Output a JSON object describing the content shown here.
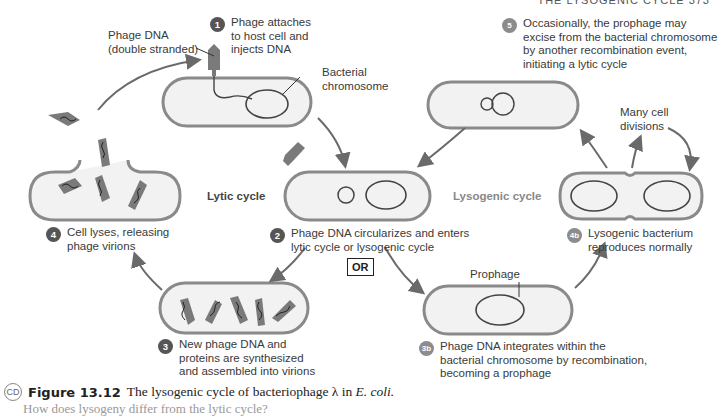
{
  "page_header": {
    "text": "THE LYSOGENIC CYCLE  373"
  },
  "labels": {
    "phage_dna": "Phage DNA",
    "phage_dna_sub": "(double stranded)",
    "bacterial_chromosome_1": "Bacterial",
    "bacterial_chromosome_2": "chromosome",
    "prophage": "Prophage",
    "many_divisions_1": "Many cell",
    "many_divisions_2": "divisions",
    "lytic_cycle": "Lytic cycle",
    "lysogenic_cycle": "Lysogenic cycle",
    "or": "OR"
  },
  "steps": [
    {
      "num": "1",
      "lines": [
        "Phage attaches",
        "to host cell and",
        "injects DNA"
      ]
    },
    {
      "num": "2",
      "lines": [
        "Phage DNA circularizes and enters",
        "lytic cycle or lysogenic cycle"
      ]
    },
    {
      "num": "3",
      "lines": [
        "New phage DNA and",
        "proteins are synthesized",
        "and assembled into virions"
      ]
    },
    {
      "num": "4",
      "lines": [
        "Cell lyses, releasing",
        "phage virions"
      ]
    },
    {
      "num": "3b",
      "lines": [
        "Phage DNA integrates within the",
        "bacterial chromosome by recombination,",
        "becoming a prophage"
      ]
    },
    {
      "num": "4b",
      "lines": [
        "Lysogenic bacterium",
        "reproduces normally"
      ]
    },
    {
      "num": "5",
      "lines": [
        "Occasionally, the prophage may",
        "excise from the bacterial chromosome",
        "by another recombination event,",
        "initiating a lytic cycle"
      ]
    }
  ],
  "caption": {
    "cd_icon": "CD",
    "figure_number": "Figure 13.12",
    "title_main": "The lysogenic cycle of bacteriophage λ in ",
    "title_italic": "E. coli.",
    "question": "How does lysogeny differ from the lytic cycle?"
  },
  "colors": {
    "cell_fill": "#f2f2f2",
    "cell_stroke": "#8a8a8a",
    "phage": "#7a7a7a",
    "dna": "#333333",
    "arrow": "#6a6a6a"
  }
}
